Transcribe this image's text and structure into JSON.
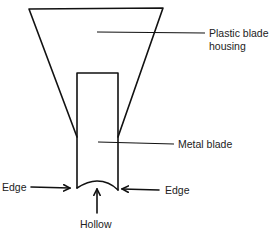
{
  "diagram": {
    "type": "labeled-schematic",
    "labels": {
      "housing_line1": "Plastic blade",
      "housing_line2": "housing",
      "blade": "Metal blade",
      "edge_left": "Edge",
      "edge_right": "Edge",
      "hollow": "Hollow"
    },
    "colors": {
      "line": "#111111",
      "text": "#222222",
      "background": "#ffffff"
    }
  }
}
